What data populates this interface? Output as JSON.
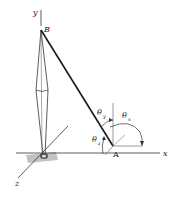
{
  "diagram": {
    "type": "3d-force-vector-angles",
    "labels": {
      "y_axis": "y",
      "x_axis": "x",
      "z_axis": "z",
      "point_b": "B",
      "point_a": "A",
      "theta": "θ",
      "theta_x_sub": "x",
      "theta_y_sub": "y",
      "theta_z_sub": "z"
    },
    "colors": {
      "line": "#222222",
      "thin_line": "#555555",
      "ground_shadow": "#9a9a9a",
      "background": "#ffffff"
    }
  }
}
